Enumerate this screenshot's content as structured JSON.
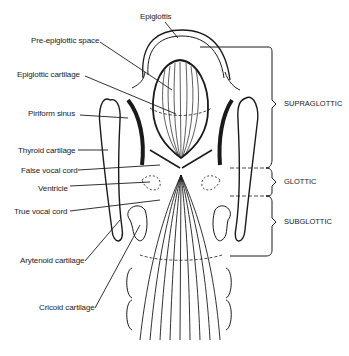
{
  "figure": {
    "type": "anatomical-diagram",
    "left_labels": [
      {
        "id": "epiglottis",
        "text": "Epiglottis"
      },
      {
        "id": "pre-epiglottic-space",
        "text": "Pre-epiglottic space"
      },
      {
        "id": "epiglottic-cartilage",
        "text": "Epiglottic cartilage"
      },
      {
        "id": "piriform-sinus",
        "text": "Piriform sinus"
      },
      {
        "id": "thyroid-cartilage",
        "text": "Thyroid cartilage"
      },
      {
        "id": "false-vocal-cord",
        "text": "False vocal cord"
      },
      {
        "id": "ventricle",
        "text": "Ventricle"
      },
      {
        "id": "true-vocal-cord",
        "text": "True vocal cord"
      },
      {
        "id": "arytenoid-cartilage",
        "text": "Arytenoid cartilage"
      },
      {
        "id": "cricoid-cartilage",
        "text": "Cricoid cartilage"
      }
    ],
    "regions": [
      {
        "id": "supraglottic",
        "text": "SUPRAGLOTTIC"
      },
      {
        "id": "glottic",
        "text": "GLOTTIC"
      },
      {
        "id": "subglottic",
        "text": "SUBGLOTTIC"
      }
    ]
  }
}
